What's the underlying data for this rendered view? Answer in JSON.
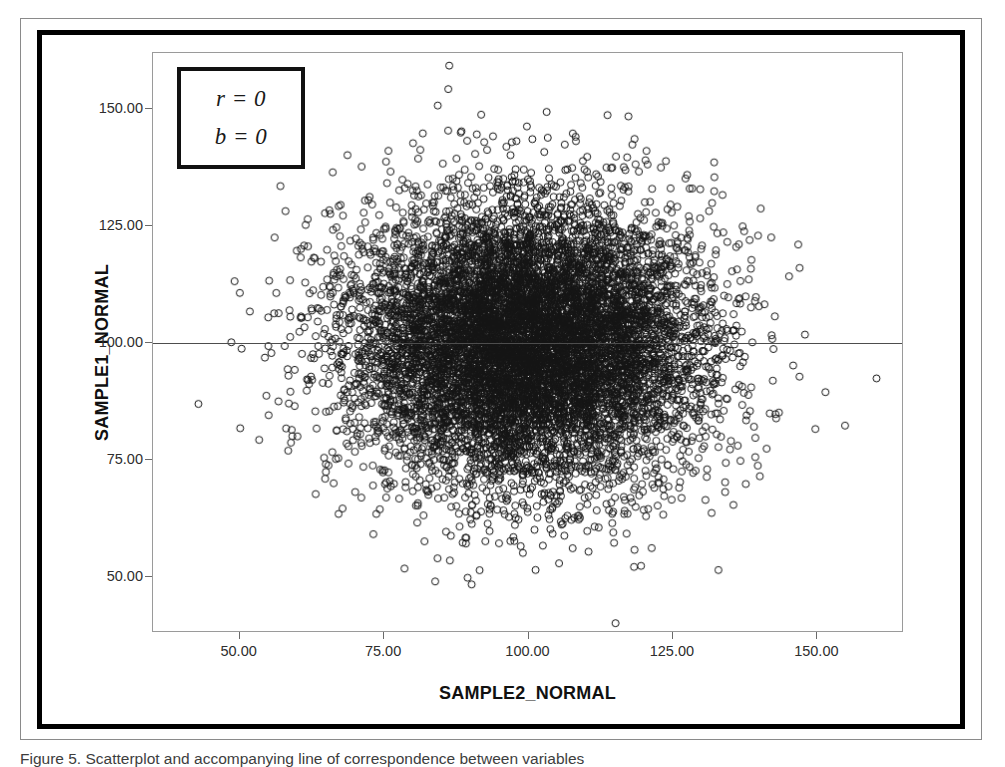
{
  "figure": {
    "caption": "Figure 5. Scatterplot and accompanying line of correspondence between variables"
  },
  "annotation": {
    "line1": "r = 0",
    "line2": "b = 0"
  },
  "axes": {
    "x_title": "SAMPLE2_NORMAL",
    "y_title": "SAMPLE1_NORMAL",
    "x_ticks": [
      "50.00",
      "75.00",
      "100.00",
      "125.00",
      "150.00"
    ],
    "y_ticks": [
      "50.00",
      "75.00",
      "100.00",
      "125.00",
      "150.00"
    ]
  },
  "colors": {
    "frame": "#000000",
    "panel_border": "#9a9a9a",
    "marker_stroke": "#141414",
    "reference_line": "#4d4d4d",
    "tick_text": "#2e2e2e",
    "background": "#ffffff"
  },
  "chart_data": {
    "type": "scatter",
    "title": "",
    "xlabel": "SAMPLE2_NORMAL",
    "ylabel": "SAMPLE1_NORMAL",
    "xlim": [
      35,
      165
    ],
    "ylim": [
      38,
      162
    ],
    "x_ticks": [
      50,
      75,
      100,
      125,
      150
    ],
    "y_ticks": [
      50,
      75,
      100,
      125,
      150
    ],
    "grid": false,
    "legend": null,
    "n_points": 10000,
    "marker": {
      "shape": "circle-open",
      "size_px": 7,
      "stroke_width": 1
    },
    "distribution": {
      "family": "bivariate-normal",
      "x_mean": 100,
      "y_mean": 100,
      "x_sd": 15,
      "y_sd": 15,
      "correlation": 0
    },
    "annotations": [
      {
        "text": "r = 0",
        "kind": "correlation",
        "value": 0
      },
      {
        "text": "b = 0",
        "kind": "slope",
        "value": 0
      }
    ],
    "reference_lines": [
      {
        "orientation": "horizontal",
        "y": 100,
        "label": "regression line (slope 0)"
      }
    ]
  }
}
